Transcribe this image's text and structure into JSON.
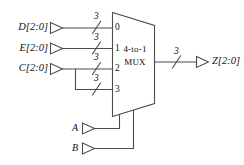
{
  "diagram": {
    "line_color": "#4d4d4d",
    "text_color": "#111111",
    "background": "#ffffff",
    "mux": {
      "line1": "4-to-1",
      "line2": "MUX",
      "port_labels": [
        "0",
        "1",
        "2",
        "3"
      ]
    },
    "data_inputs": [
      {
        "name": "D",
        "bits": "[2:0]",
        "label": "D[2:0]",
        "port": "0",
        "bus_width": "3"
      },
      {
        "name": "E",
        "bits": "[2:0]",
        "label": "E[2:0]",
        "port": "1",
        "bus_width": "3"
      },
      {
        "name": "C",
        "bits": "[2:0]",
        "label": "C[2:0]",
        "port": "2",
        "bus_width": "3"
      },
      {
        "name": "C",
        "bits": "[2:0]",
        "label": "C[2:0]",
        "port": "3",
        "bus_width": "3"
      }
    ],
    "select_inputs": [
      {
        "name": "A",
        "label": "A"
      },
      {
        "name": "B",
        "label": "B"
      }
    ],
    "output": {
      "name": "Z",
      "bits": "[2:0]",
      "label": "Z[2:0]",
      "bus_width": "3"
    },
    "bus_widths": {
      "in0": "3",
      "in1": "3",
      "in2": "3",
      "in3": "3",
      "out": "3"
    }
  }
}
